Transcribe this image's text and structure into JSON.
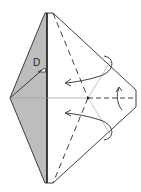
{
  "diagram": {
    "label_point": "D",
    "colors": {
      "paper_shaded": "#bdbdbd",
      "paper_white": "#ffffff",
      "line": "#2a2a2a",
      "crease_light": "#9a9a9a"
    },
    "annotations": [
      {
        "type": "valley-fold",
        "style": "dashed",
        "description": "diagonal dashed line from top to bottom through center"
      },
      {
        "type": "valley-fold",
        "style": "dashed",
        "description": "horizontal dashed line on right half"
      },
      {
        "type": "arrow",
        "description": "upper curved arrow folding flap toward left"
      },
      {
        "type": "arrow",
        "description": "lower curved arrow folding flap toward left"
      },
      {
        "type": "arrow",
        "description": "small curved arrow near right tip"
      }
    ]
  }
}
